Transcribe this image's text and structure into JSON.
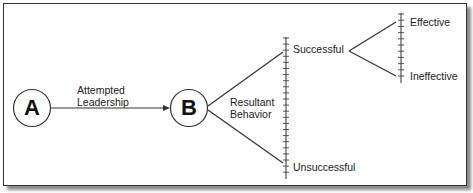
{
  "diagram": {
    "nodes": [
      {
        "id": "A",
        "label": "A"
      },
      {
        "id": "B",
        "label": "B"
      }
    ],
    "edge_label": {
      "line1": "Attempted",
      "line2": "Leadership"
    },
    "branch_label": {
      "line1": "Resultant",
      "line2": "Behavior"
    },
    "outcomes": {
      "successful": "Successful",
      "unsuccessful": "Unsuccessful",
      "effective": "Effective",
      "ineffective": "Ineffective"
    }
  }
}
